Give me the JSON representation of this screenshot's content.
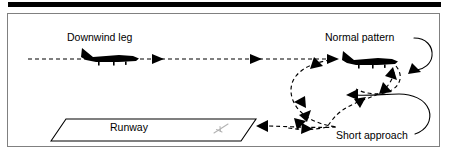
{
  "figure": {
    "background_color": "#ffffff",
    "panel": {
      "border_color": "#808080",
      "fill_color": "#ffffff",
      "x": 7,
      "y": 13,
      "width": 433,
      "height": 134
    },
    "top_rule": {
      "color": "#000000",
      "x": 8,
      "y": 2,
      "width": 433,
      "height": 5
    }
  },
  "labels": {
    "downwind_leg": "Downwind leg",
    "normal_pattern": "Normal pattern",
    "short_approach": "Short approach",
    "runway": "Runway"
  },
  "colors": {
    "ink": "#000000",
    "panel_border": "#808080",
    "threshold_marking": "#b4b4b4",
    "paper": "#ffffff"
  },
  "icons": {
    "aircraft_downwind": "aircraft-silhouette-icon",
    "aircraft_normal_pattern": "aircraft-silhouette-icon",
    "runway_threshold": "runway-threshold-marking-icon"
  },
  "path_styles": {
    "flight_path": "dashed",
    "leader_line": "solid",
    "dash_pattern": "4 3"
  },
  "geometry": {
    "downwind_leg_y": 59,
    "downwind_leg_x_start": 28,
    "downwind_leg_x_end": 330,
    "runway_label_x": 110,
    "runway_label_y": 131
  }
}
